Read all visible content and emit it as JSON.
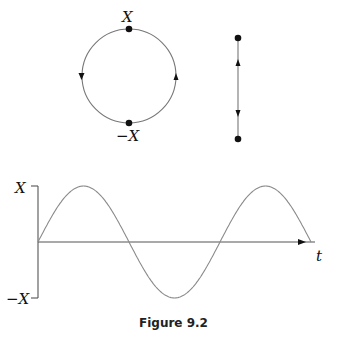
{
  "caption": "Figure 9.2",
  "circle_diagram": {
    "top_label": "X",
    "bottom_label": "−X",
    "direction": "counterclockwise"
  },
  "line_diagram": {
    "description": "vertical oscillation between two endpoints"
  },
  "chart_data": {
    "type": "line",
    "title": "",
    "xlabel": "t",
    "ylabel": "",
    "y_tick_labels": [
      "X",
      "−X"
    ],
    "ylim": [
      -1,
      1
    ],
    "function": "x(t) = X sin(t)",
    "x": [
      0,
      0.5,
      1.0,
      1.5,
      2.0
    ],
    "y": [
      0,
      1,
      0,
      -1,
      0,
      1,
      0
    ],
    "periods_shown": 1.5,
    "grid": false,
    "legend": null
  },
  "colors": {
    "curve": "#8a8a8a",
    "axes": "#555555",
    "dots": "#111111"
  }
}
